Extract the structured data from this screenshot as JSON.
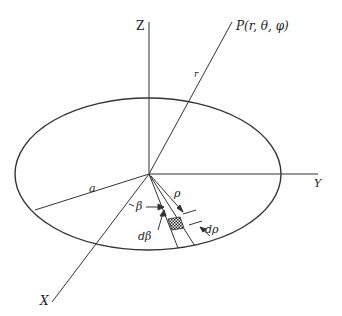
{
  "diagram": {
    "colors": {
      "stroke": "#333333",
      "background": "#ffffff"
    },
    "labels": {
      "z_axis": "Z",
      "y_axis": "Y",
      "x_axis": "X",
      "point": "P(r, θ, φ)",
      "radius_r": "r",
      "disk_radius": "a",
      "rho": "ρ",
      "beta": "β",
      "d_beta": "dβ",
      "d_rho": "dρ"
    }
  }
}
